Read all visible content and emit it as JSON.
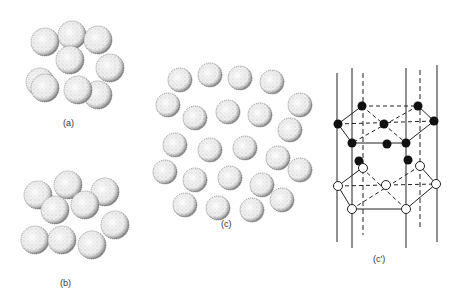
{
  "figures": {
    "a": {
      "label": "(a)"
    },
    "b": {
      "label": "(b)"
    },
    "c": {
      "label": "(c)"
    },
    "c_prime": {
      "label": "(c′)"
    }
  },
  "colors": {
    "ink": "#222222",
    "sphere_fill": "#f4f4f4",
    "filled_atom": "#111111",
    "open_atom": "#ffffff"
  }
}
